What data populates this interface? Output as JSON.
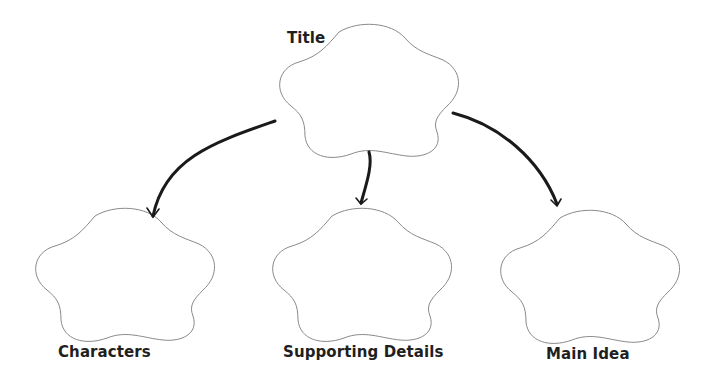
{
  "diagram": {
    "type": "graphic-organizer",
    "colors": {
      "cloud_stroke": "#8a8a8a",
      "arrow": "#1a1a1a",
      "text": "#1f1f1f",
      "background": "#ffffff"
    },
    "nodes": [
      {
        "id": "title",
        "label": "Title"
      },
      {
        "id": "characters",
        "label": "Characters"
      },
      {
        "id": "supporting",
        "label": "Supporting Details"
      },
      {
        "id": "main",
        "label": "Main Idea"
      }
    ],
    "edges": [
      {
        "from": "title",
        "to": "characters"
      },
      {
        "from": "title",
        "to": "supporting"
      },
      {
        "from": "title",
        "to": "main"
      }
    ]
  }
}
